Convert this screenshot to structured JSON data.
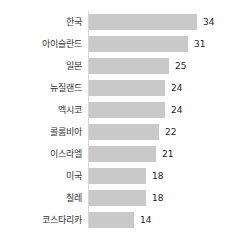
{
  "chart_data": {
    "type": "bar",
    "orientation": "horizontal",
    "title": "",
    "xlabel": "",
    "ylabel": "",
    "grid": false,
    "legend": null,
    "xlim": [
      0,
      34
    ],
    "sorted": "descending",
    "categories": [
      "한국",
      "아이슬란드",
      "일본",
      "뉴질랜드",
      "멕시코",
      "콜롬비아",
      "이스라엘",
      "미국",
      "칠레",
      "코스타리카"
    ],
    "values": [
      34,
      31,
      25,
      24,
      24,
      22,
      21,
      18,
      18,
      14
    ],
    "value_labels": [
      "34",
      "31",
      "25",
      "24",
      "24",
      "22",
      "21",
      "18",
      "18",
      "14"
    ],
    "colors": {
      "bar": "#c9c9c9",
      "axis": "#d6d6d6",
      "label_text": "#333333",
      "value_text": "#222222",
      "background": "#ffffff"
    }
  }
}
